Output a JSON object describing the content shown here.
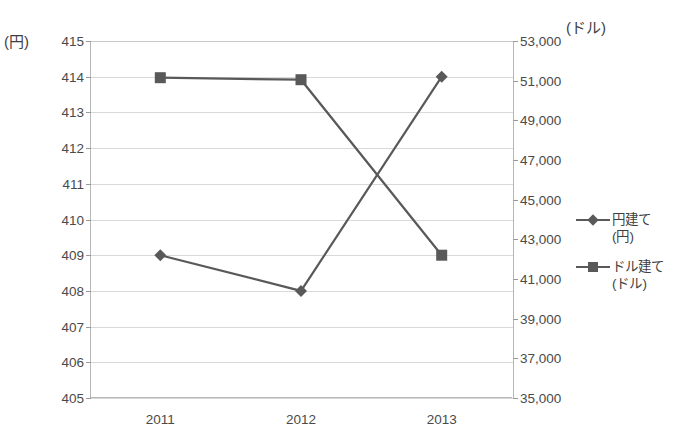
{
  "chart_data": {
    "type": "line",
    "title": "",
    "xlabel": "",
    "categories": [
      "2011",
      "2012",
      "2013"
    ],
    "grid": true,
    "legend_position": "right",
    "axes": {
      "left": {
        "unit_label": "(円)",
        "ylim": [
          405,
          415
        ],
        "step": 1,
        "ticks": [
          "405",
          "406",
          "407",
          "408",
          "409",
          "410",
          "411",
          "412",
          "413",
          "414",
          "415"
        ]
      },
      "right": {
        "unit_label": "(ドル)",
        "ylim": [
          35000,
          53000
        ],
        "step": 2000,
        "ticks": [
          "35,000",
          "37,000",
          "39,000",
          "41,000",
          "43,000",
          "45,000",
          "47,000",
          "49,000",
          "51,000",
          "53,000"
        ]
      }
    },
    "series": [
      {
        "name": "円建て",
        "sub": "(円)",
        "axis": "left",
        "marker": "diamond",
        "color": "#595959",
        "values": [
          409,
          408,
          414
        ]
      },
      {
        "name": "ドル建て",
        "sub": "(ドル)",
        "axis": "right",
        "marker": "square",
        "color": "#595959",
        "values": [
          51150,
          51050,
          42200
        ]
      }
    ]
  },
  "title_strip": "　　　　　　　　　　　　　　　　",
  "colors": {
    "series": "#595959",
    "gridline": "#d9d9d9",
    "axis": "#b6b6b6",
    "text": "#404040",
    "background": "#ffffff"
  }
}
